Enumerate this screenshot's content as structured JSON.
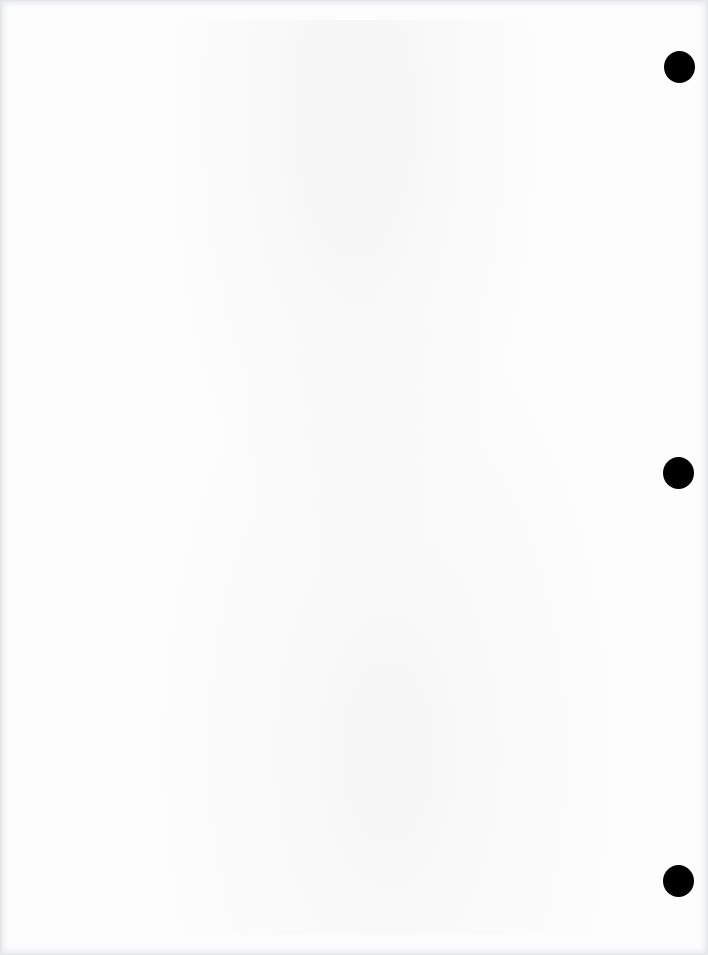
{
  "document": {
    "type": "blank scanned page",
    "text_content": "",
    "background_color": "#fdfdfd",
    "edge_shadow_color": "#e6e7ea",
    "punch_holes": [
      {
        "label": "top",
        "x": 664,
        "y": 51,
        "color": "#000000"
      },
      {
        "label": "middle",
        "x": 663,
        "y": 457,
        "color": "#000000"
      },
      {
        "label": "bottom",
        "x": 663,
        "y": 865,
        "color": "#000000"
      }
    ]
  }
}
